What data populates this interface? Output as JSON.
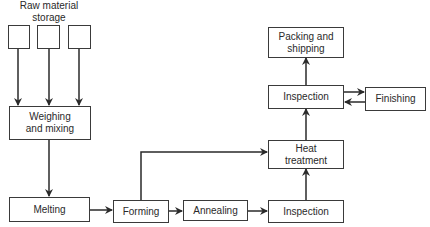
{
  "diagram": {
    "storage_label": "Raw material\nstorage",
    "storage_label_line1": "Raw material",
    "storage_label_line2": "storage",
    "nodes": {
      "weighing": {
        "line1": "Weighing",
        "line2": "and mixing"
      },
      "melting": "Melting",
      "forming": "Forming",
      "annealing": "Annealing",
      "inspection_lower": "Inspection",
      "heat_treatment": {
        "line1": "Heat",
        "line2": "treatment"
      },
      "inspection_upper": "Inspection",
      "finishing": "Finishing",
      "packing": {
        "line1": "Packing and",
        "line2": "shipping"
      }
    },
    "edges": [
      [
        "storage-1",
        "weighing"
      ],
      [
        "storage-2",
        "weighing"
      ],
      [
        "storage-3",
        "weighing"
      ],
      [
        "weighing",
        "melting"
      ],
      [
        "melting",
        "forming"
      ],
      [
        "forming",
        "annealing"
      ],
      [
        "forming",
        "heat_treatment"
      ],
      [
        "annealing",
        "inspection_lower"
      ],
      [
        "inspection_lower",
        "heat_treatment"
      ],
      [
        "heat_treatment",
        "inspection_upper"
      ],
      [
        "inspection_upper",
        "finishing"
      ],
      [
        "finishing",
        "inspection_upper"
      ],
      [
        "inspection_upper",
        "packing"
      ]
    ]
  }
}
